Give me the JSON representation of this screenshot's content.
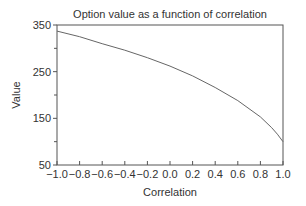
{
  "chart_data": {
    "type": "line",
    "title": "Option value as a function of correlation",
    "xlabel": "Correlation",
    "ylabel": "Value",
    "xlim": [
      -1.0,
      1.0
    ],
    "ylim": [
      50,
      350
    ],
    "x_ticks": [
      "−1.0",
      "−0.8",
      "−0.6",
      "−0.4",
      "−0.2",
      "0.0",
      "0.2",
      "0.4",
      "0.6",
      "0.8",
      "1.0"
    ],
    "y_ticks": [
      "50",
      "150",
      "250",
      "350"
    ],
    "y_minor_ticks": [
      100,
      200,
      300
    ],
    "grid": false,
    "legend": null,
    "series": [
      {
        "name": "Option value",
        "x": [
          -1.0,
          -0.8,
          -0.6,
          -0.4,
          -0.2,
          0.0,
          0.2,
          0.4,
          0.6,
          0.8,
          0.9,
          0.95,
          1.0
        ],
        "values": [
          337,
          325,
          310,
          296,
          280,
          262,
          241,
          216,
          188,
          153,
          130,
          116,
          100
        ],
        "color": "#666666"
      }
    ]
  }
}
